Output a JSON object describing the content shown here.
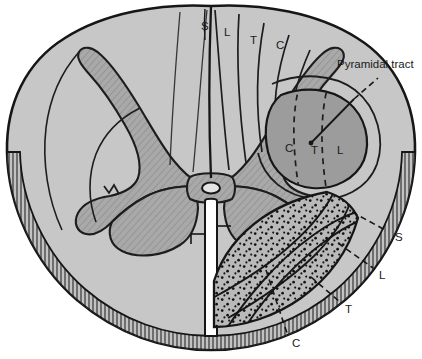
{
  "figure": {
    "type": "anatomical-diagram"
  },
  "annotations": {
    "pyramidal_tract_label": "Pyramidal tract"
  },
  "dorsal_column_labels": [
    {
      "text": "S",
      "x": 201,
      "y": 21,
      "name": "dorsal-column-sacral"
    },
    {
      "text": "L",
      "x": 224,
      "y": 27,
      "name": "dorsal-column-lumbar"
    },
    {
      "text": "T",
      "x": 250,
      "y": 35,
      "name": "dorsal-column-thoracic"
    },
    {
      "text": "C",
      "x": 276,
      "y": 40,
      "name": "dorsal-column-cervical"
    }
  ],
  "pyramidal_tract_labels": [
    {
      "text": "C",
      "x": 285,
      "y": 143,
      "name": "pyramidal-cervical"
    },
    {
      "text": "T",
      "x": 311,
      "y": 145,
      "name": "pyramidal-thoracic"
    },
    {
      "text": "L",
      "x": 337,
      "y": 145,
      "name": "pyramidal-lumbar"
    }
  ],
  "spinothalamic_labels": [
    {
      "text": "S",
      "x": 395,
      "y": 232,
      "name": "spinothalamic-sacral"
    },
    {
      "text": "L",
      "x": 379,
      "y": 270,
      "name": "spinothalamic-lumbar"
    },
    {
      "text": "T",
      "x": 345,
      "y": 304,
      "name": "spinothalamic-thoracic"
    },
    {
      "text": "C",
      "x": 292,
      "y": 338,
      "name": "spinothalamic-cervical"
    }
  ],
  "colors": {
    "white_matter": "#c9c9c9",
    "gray_matter": "#a8a8a8",
    "pyramidal_tract": "#9e9e9e",
    "spinothalamic_tract": "#b4b4b4",
    "outline": "#161616",
    "text": "#1a1a1a",
    "background": "#ffffff"
  }
}
